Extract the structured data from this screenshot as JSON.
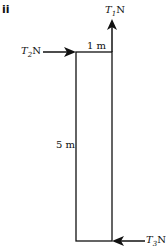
{
  "part_label": "ii",
  "forces": {
    "t1": {
      "symbol": "T",
      "sub": "1",
      "unit": "N"
    },
    "t2": {
      "symbol": "T",
      "sub": "2",
      "unit": "N"
    },
    "t3": {
      "symbol": "T",
      "sub": "3",
      "unit": "N"
    }
  },
  "dimensions": {
    "width": "1 m",
    "height": "5 m"
  },
  "colors": {
    "line": "#111111",
    "background": "#ffffff"
  }
}
